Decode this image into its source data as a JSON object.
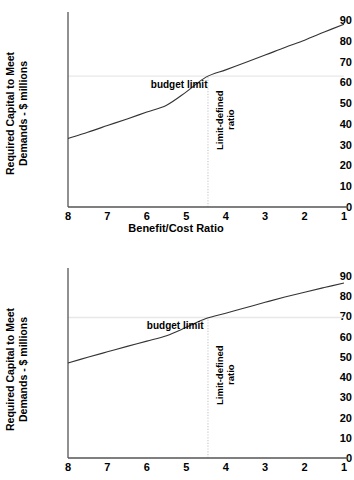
{
  "figure": {
    "background": "#ffffff",
    "axis_color": "#555555",
    "curve_color": "#333333",
    "gridline_color": "#e8e8e8"
  },
  "chart_data": [
    {
      "id": "top",
      "type": "line",
      "title": "",
      "xlabel": "Benefit/Cost Ratio",
      "ylabel": "Required Capital to Meet\nDemands - $ millions",
      "xlim": [
        8,
        1
      ],
      "ylim": [
        0,
        90
      ],
      "x_reversed": true,
      "grid": false,
      "legend": "none",
      "xticks": [
        "8",
        "7",
        "6",
        "5",
        "4",
        "3",
        "2",
        "1"
      ],
      "xtick_values": [
        8,
        7,
        6,
        5,
        4,
        3,
        2,
        1
      ],
      "yticks": [
        "0",
        "10",
        "20",
        "30",
        "40",
        "50",
        "60",
        "70",
        "80",
        "90"
      ],
      "ytick_values": [
        0,
        10,
        20,
        30,
        40,
        50,
        60,
        70,
        80,
        90
      ],
      "series": [
        {
          "name": "required capital",
          "x": [
            8.0,
            7.5,
            7.0,
            6.5,
            6.0,
            5.5,
            5.0,
            4.5,
            4.0,
            3.5,
            3.0,
            2.5,
            2.0,
            1.5,
            1.0
          ],
          "values": [
            33.0,
            36.0,
            39.2,
            42.4,
            45.7,
            49.0,
            55.4,
            62.5,
            66.0,
            69.5,
            73.1,
            76.8,
            80.3,
            84.2,
            88.0
          ]
        }
      ],
      "annotations": [
        {
          "name": "budget-limit",
          "label": "budget limit",
          "type": "hline",
          "y": 63,
          "label_x": 5.9
        },
        {
          "name": "limit-defined-ratio",
          "label": "Limit-defined\nratio",
          "type": "vline",
          "x": 4.45,
          "label_y": 33
        }
      ]
    },
    {
      "id": "bottom",
      "type": "line",
      "title": "",
      "xlabel": "",
      "ylabel": "Required Capital to Meet\nDemands - $ millions",
      "xlim": [
        8,
        1
      ],
      "ylim": [
        0,
        90
      ],
      "x_reversed": true,
      "grid": false,
      "legend": "none",
      "xticks": [
        "8",
        "7",
        "6",
        "5",
        "4",
        "3",
        "2",
        "1"
      ],
      "xtick_values": [
        8,
        7,
        6,
        5,
        4,
        3,
        2,
        1
      ],
      "yticks": [
        "0",
        "10",
        "20",
        "30",
        "40",
        "50",
        "60",
        "70",
        "80",
        "90"
      ],
      "ytick_values": [
        0,
        10,
        20,
        30,
        40,
        50,
        60,
        70,
        80,
        90
      ],
      "series": [
        {
          "name": "required capital",
          "x": [
            8.0,
            7.5,
            7.0,
            6.5,
            6.0,
            5.5,
            5.0,
            4.5,
            4.0,
            3.5,
            3.0,
            2.5,
            2.0,
            1.5,
            1.0
          ],
          "values": [
            47.0,
            49.8,
            52.5,
            55.2,
            57.8,
            60.5,
            64.6,
            69.0,
            71.6,
            74.3,
            77.0,
            79.6,
            82.0,
            84.3,
            86.5
          ]
        }
      ],
      "annotations": [
        {
          "name": "budget-limit",
          "label": "budget limit",
          "type": "hline",
          "y": 69.5,
          "label_x": 6.0
        },
        {
          "name": "limit-defined-ratio",
          "label": "Limit-defined\nratio",
          "type": "vline",
          "x": 4.45,
          "label_y": 33
        }
      ]
    }
  ]
}
